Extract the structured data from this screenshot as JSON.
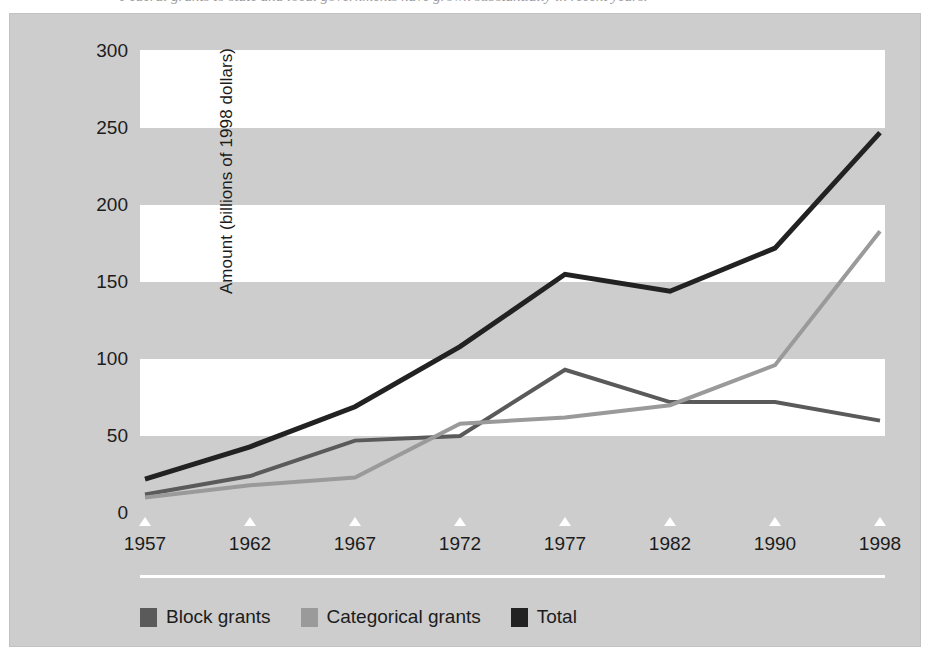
{
  "figure": {
    "caption_partial": "Federal grants to state and local governments have grown substantially in recent years.",
    "background_color": "#cdcdcd",
    "band_color": "#ffffff"
  },
  "chart_data": {
    "type": "line",
    "title": "",
    "xlabel": "",
    "ylabel": "Amount (billions of 1998 dollars)",
    "categories": [
      "1957",
      "1962",
      "1967",
      "1972",
      "1977",
      "1982",
      "1990",
      "1998"
    ],
    "ylim": [
      0,
      300
    ],
    "yticks": [
      0,
      50,
      100,
      150,
      200,
      250,
      300
    ],
    "ytick_labels": [
      "0",
      "50",
      "100",
      "150",
      "200",
      "250",
      "300"
    ],
    "grid": "horizontal-bands",
    "legend_position": "bottom-left",
    "series": [
      {
        "name": "Block grants",
        "color": "#5a5a5a",
        "values": [
          12,
          24,
          47,
          50,
          93,
          72,
          72,
          60
        ]
      },
      {
        "name": "Categorical grants",
        "color": "#9a9a9a",
        "values": [
          10,
          18,
          23,
          58,
          62,
          70,
          96,
          183
        ]
      },
      {
        "name": "Total",
        "color": "#222222",
        "values": [
          22,
          43,
          69,
          108,
          155,
          144,
          172,
          247
        ]
      }
    ]
  }
}
